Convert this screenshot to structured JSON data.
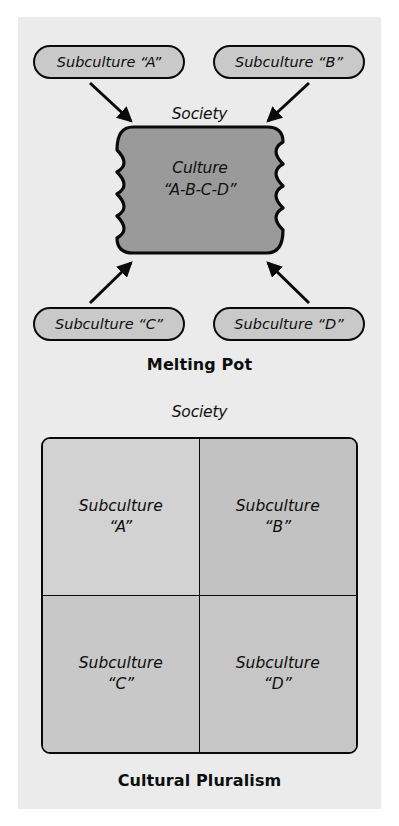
{
  "figure": {
    "background_color": "#ffffff",
    "panel_color": "#ebebeb"
  },
  "melting_pot": {
    "caption": "Melting Pot",
    "society_label": "Society",
    "center": {
      "line1": "Culture",
      "line2": "“A-B-C-D”",
      "fill_color": "#9a9a9a",
      "stroke_color": "#0a0a0a"
    },
    "subcultures": [
      {
        "id": "a",
        "label": "Subculture “A”",
        "fill_color": "#c9c9c9"
      },
      {
        "id": "b",
        "label": "Subculture “B”",
        "fill_color": "#c9c9c9"
      },
      {
        "id": "c",
        "label": "Subculture “C”",
        "fill_color": "#c9c9c9"
      },
      {
        "id": "d",
        "label": "Subculture “D”",
        "fill_color": "#c9c9c9"
      }
    ],
    "arrows": [
      {
        "from": "a",
        "to": "center",
        "direction": "down-right"
      },
      {
        "from": "b",
        "to": "center",
        "direction": "down-left"
      },
      {
        "from": "c",
        "to": "center",
        "direction": "up-right"
      },
      {
        "from": "d",
        "to": "center",
        "direction": "up-left"
      }
    ]
  },
  "cultural_pluralism": {
    "caption": "Cultural Pluralism",
    "society_label": "Society",
    "quadrants": [
      {
        "id": "a",
        "line1": "Subculture",
        "line2": "“A”",
        "fill_color": "#d2d2d2"
      },
      {
        "id": "b",
        "line1": "Subculture",
        "line2": "“B”",
        "fill_color": "#c2c2c2"
      },
      {
        "id": "c",
        "line1": "Subculture",
        "line2": "“C”",
        "fill_color": "#c8c8c8"
      },
      {
        "id": "d",
        "line1": "Subculture",
        "line2": "“D”",
        "fill_color": "#c6c6c6"
      }
    ]
  }
}
